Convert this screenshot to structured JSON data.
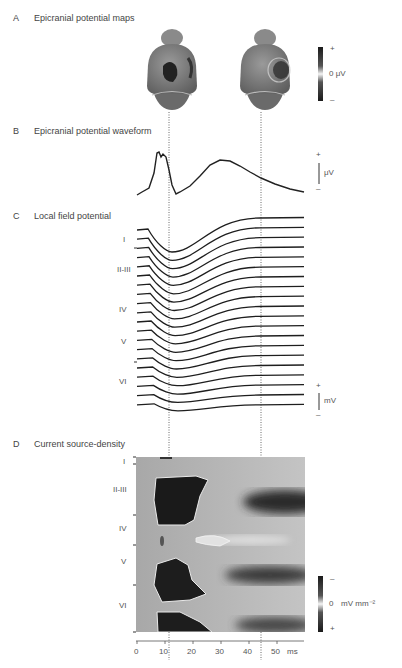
{
  "panels": {
    "A": {
      "letter": "A",
      "title": "Epicranial potential maps",
      "colorbar": {
        "plus": "+",
        "minus": "–",
        "label": "0 μV"
      }
    },
    "B": {
      "letter": "B",
      "title": "Epicranial potential waveform",
      "scalebar": {
        "plus": "+",
        "minus": "–",
        "label": "μV"
      }
    },
    "C": {
      "letter": "C",
      "title": "Local field potential",
      "layers": [
        "I",
        "II-III",
        "IV",
        "V",
        "VI"
      ],
      "scalebar": {
        "plus": "+",
        "minus": "–",
        "label": "mV"
      }
    },
    "D": {
      "letter": "D",
      "title": "Current source-density",
      "layers": [
        "I",
        "II-III",
        "IV",
        "V",
        "VI"
      ],
      "colorbar": {
        "minus": "–",
        "plus": "+",
        "zero": "0",
        "unit": "mV mm⁻²"
      }
    }
  },
  "chart_data": [
    {
      "type": "line",
      "title": "Epicranial potential waveform",
      "xlabel": "Time (ms)",
      "ylabel": "μV",
      "x": [
        0,
        4,
        6,
        8,
        9,
        10,
        11,
        12,
        14,
        16,
        20,
        25,
        30,
        35,
        40,
        45,
        50,
        55
      ],
      "values": [
        -0.9,
        -0.8,
        0.9,
        0.85,
        0.92,
        0.8,
        0.3,
        -0.6,
        -0.9,
        -0.85,
        -0.5,
        0.1,
        0.4,
        0.35,
        0.15,
        -0.05,
        -0.25,
        -0.4
      ],
      "annotations": [
        "dotted line at ~11 ms",
        "dotted line at ~45 ms"
      ]
    },
    {
      "type": "line",
      "title": "Local field potential",
      "xlabel": "Time (ms)",
      "ylabel": "mV",
      "series_count": 20,
      "layers": [
        "I",
        "II-III",
        "IV",
        "V",
        "VI"
      ],
      "description": "Stacked depth traces; negative deflection onset ~5 ms, trough ~12-15 ms, recovery to baseline by ~40 ms in superficial channels; deep channels show smaller, slower responses"
    },
    {
      "type": "heatmap",
      "title": "Current source-density",
      "xlabel": "ms",
      "x_ticks": [
        0,
        10,
        20,
        30,
        40,
        50
      ],
      "xlim": [
        0,
        58
      ],
      "y_layers": [
        "I",
        "II-III",
        "IV",
        "V",
        "VI"
      ],
      "colorbar": {
        "label": "mV mm⁻²",
        "top": "–",
        "middle": "0",
        "bottom": "+"
      },
      "annotations": [
        "dotted line at ~11 ms",
        "dotted line at ~45 ms"
      ]
    }
  ]
}
